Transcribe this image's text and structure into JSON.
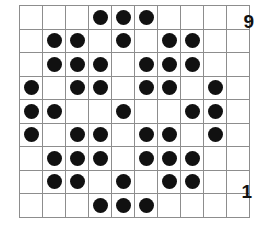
{
  "figure": {
    "type": "dot-matrix-grid",
    "columns": 10,
    "rows": 9,
    "filled_symbol": "●",
    "dot_color": "#111111",
    "grid_line_color": "#8d8d8d",
    "border_color": "#6e6e6e",
    "background_color": "#ffffff"
  },
  "labels": {
    "top_right": "9",
    "bottom_right": "1"
  },
  "chart_data": {
    "type": "heatmap",
    "title": "",
    "xlabel": "",
    "ylabel": "",
    "columns": 10,
    "rows": 9,
    "row_labels": [
      "9",
      "8",
      "7",
      "6",
      "5",
      "4",
      "3",
      "2",
      "1"
    ],
    "column_labels": [
      "1",
      "2",
      "3",
      "4",
      "5",
      "6",
      "7",
      "8",
      "9",
      "10"
    ],
    "legend": [],
    "grid": true,
    "values": [
      [
        0,
        0,
        0,
        1,
        1,
        1,
        0,
        0,
        0,
        0
      ],
      [
        0,
        1,
        1,
        0,
        1,
        0,
        1,
        1,
        0,
        0
      ],
      [
        0,
        1,
        1,
        1,
        0,
        1,
        1,
        1,
        0,
        0
      ],
      [
        1,
        0,
        1,
        1,
        0,
        1,
        1,
        0,
        1,
        0
      ],
      [
        1,
        1,
        0,
        0,
        1,
        0,
        0,
        1,
        1,
        0
      ],
      [
        1,
        0,
        1,
        1,
        0,
        1,
        1,
        0,
        1,
        0
      ],
      [
        0,
        1,
        1,
        1,
        0,
        1,
        1,
        1,
        0,
        0
      ],
      [
        0,
        1,
        1,
        0,
        1,
        0,
        1,
        1,
        0,
        0
      ],
      [
        0,
        0,
        0,
        1,
        1,
        1,
        0,
        0,
        0,
        0
      ]
    ],
    "filled_counts_per_row": [
      3,
      5,
      6,
      6,
      5,
      6,
      6,
      5,
      3
    ],
    "total_filled": 45
  }
}
